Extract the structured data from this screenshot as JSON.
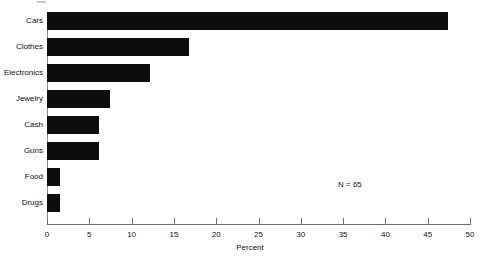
{
  "chart_data": {
    "type": "bar",
    "orientation": "horizontal",
    "title": "",
    "xlabel": "Percent",
    "ylabel": "",
    "categories": [
      "Cars",
      "Clothes",
      "Electronics",
      "Jewelry",
      "Cash",
      "Guns",
      "Food",
      "Drugs"
    ],
    "values": [
      47.4,
      16.8,
      12.2,
      7.5,
      6.1,
      6.1,
      1.5,
      1.5
    ],
    "xlim": [
      0,
      50
    ],
    "xticks": [
      0,
      5,
      10,
      15,
      20,
      25,
      30,
      35,
      40,
      45,
      50
    ],
    "xtick_labels": [
      "0",
      "5",
      "10",
      "15",
      "20",
      "25",
      "30",
      "35",
      "40",
      "45",
      "50"
    ],
    "grid": false,
    "legend": null,
    "bar_color": "#0d0d0d",
    "annotations": [
      {
        "text": "N = 65",
        "x_percent": 36.5,
        "y_category": "Food"
      }
    ]
  },
  "annotation_n": "N = 65",
  "axis": {
    "x_title": "Percent"
  }
}
